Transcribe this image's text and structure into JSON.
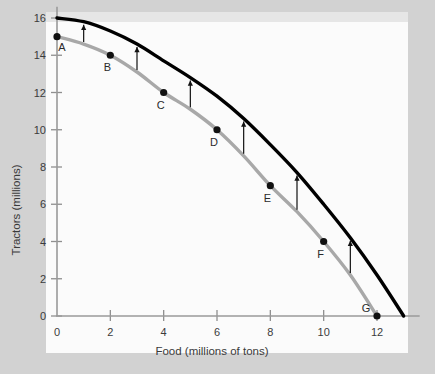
{
  "chart_data": {
    "type": "line",
    "title": "",
    "xlabel": "Food (millions of tons)",
    "ylabel": "Tractors (millions)",
    "xlim": [
      0,
      13.6
    ],
    "ylim": [
      0,
      16.6
    ],
    "xticks": [
      0,
      2,
      4,
      6,
      8,
      10,
      12
    ],
    "yticks": [
      0,
      2,
      4,
      6,
      8,
      10,
      12,
      14,
      16
    ],
    "xticklabels": [
      "0",
      "2",
      "4",
      "6",
      "8",
      "10",
      "12"
    ],
    "yticklabels": [
      "0",
      "2",
      "4",
      "6",
      "8",
      "10",
      "12",
      "14",
      "16"
    ],
    "grid": false,
    "legend": "none",
    "series": [
      {
        "name": "original-ppf",
        "color": "#a8a8a8",
        "x": [
          0,
          1,
          2,
          3,
          4,
          5,
          6,
          7,
          8,
          9,
          10,
          11,
          12
        ],
        "y": [
          15.0,
          14.6,
          14.0,
          13.1,
          12.0,
          11.1,
          10.0,
          8.6,
          7.0,
          5.6,
          4.0,
          2.2,
          0.0
        ]
      },
      {
        "name": "shifted-ppf",
        "color": "#000000",
        "x": [
          0,
          1,
          2,
          3,
          4,
          5,
          6,
          7,
          8,
          9,
          10,
          11,
          12,
          13
        ],
        "y": [
          16.0,
          15.8,
          15.3,
          14.6,
          13.7,
          12.8,
          11.8,
          10.6,
          9.2,
          7.7,
          6.0,
          4.2,
          2.2,
          0.0
        ]
      }
    ],
    "points": [
      {
        "label": "A",
        "x": 0,
        "y": 15,
        "label_dx": 5,
        "label_dy": 14
      },
      {
        "label": "B",
        "x": 2,
        "y": 14,
        "label_dx": -3,
        "label_dy": 16
      },
      {
        "label": "C",
        "x": 4,
        "y": 12,
        "label_dx": -3,
        "label_dy": 16
      },
      {
        "label": "D",
        "x": 6,
        "y": 10,
        "label_dx": -3,
        "label_dy": 16
      },
      {
        "label": "E",
        "x": 8,
        "y": 7,
        "label_dx": -3,
        "label_dy": 16
      },
      {
        "label": "F",
        "x": 10,
        "y": 4,
        "label_dx": -3,
        "label_dy": 16
      },
      {
        "label": "G",
        "x": 12,
        "y": 0,
        "label_dx": -11,
        "label_dy": -4
      }
    ],
    "shift_arrows": [
      {
        "x": 1.0,
        "y_from": 14.6,
        "y_to": 15.8
      },
      {
        "x": 3.0,
        "y_from": 13.1,
        "y_to": 14.6
      },
      {
        "x": 5.0,
        "y_from": 11.1,
        "y_to": 12.8
      },
      {
        "x": 7.0,
        "y_from": 8.6,
        "y_to": 10.6
      },
      {
        "x": 9.0,
        "y_from": 5.6,
        "y_to": 7.7
      },
      {
        "x": 11.0,
        "y_from": 2.2,
        "y_to": 4.2
      }
    ],
    "annotations": [
      "Upward arrows indicate the outward shift of the production possibilities frontier."
    ]
  }
}
